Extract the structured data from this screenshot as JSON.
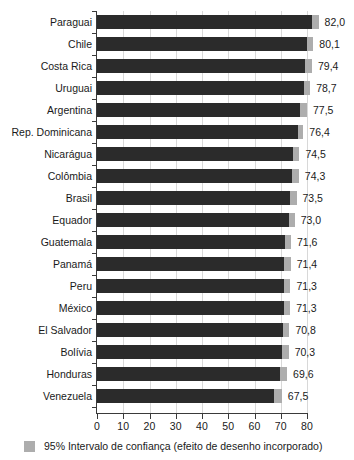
{
  "chart_data": {
    "type": "bar",
    "orientation": "horizontal",
    "title": "",
    "subtitle": "",
    "xlabel": "",
    "ylabel": "",
    "xlim": [
      0,
      80
    ],
    "xticks": [
      0,
      10,
      20,
      30,
      40,
      50,
      60,
      70,
      80
    ],
    "xtick_labels": [
      "0",
      "10",
      "20",
      "30",
      "40",
      "50",
      "60",
      "70",
      "80"
    ],
    "grid": true,
    "grid_axis": "x",
    "legend_position": "bottom-left",
    "categories": [
      "Paraguai",
      "Chile",
      "Costa Rica",
      "Uruguai",
      "Argentina",
      "Rep. Dominicana",
      "Nicarágua",
      "Colômbia",
      "Brasil",
      "Equador",
      "Guatemala",
      "Panamá",
      "Peru",
      "México",
      "El Salvador",
      "Bolívia",
      "Honduras",
      "Venezuela"
    ],
    "values": [
      82.0,
      80.1,
      79.4,
      78.7,
      77.5,
      76.4,
      74.5,
      74.3,
      73.5,
      73.0,
      71.6,
      71.4,
      71.3,
      71.3,
      70.8,
      70.3,
      69.6,
      67.5
    ],
    "value_labels": [
      "82,0",
      "80,1",
      "79,4",
      "78,7",
      "77,5",
      "76,4",
      "74,5",
      "74,3",
      "73,5",
      "73,0",
      "71,6",
      "71,4",
      "71,3",
      "71,3",
      "70,8",
      "70,3",
      "69,6",
      "67,5"
    ],
    "ci_upper": [
      84.4,
      82.4,
      81.9,
      81.2,
      80.0,
      78.6,
      77.1,
      76.9,
      76.0,
      75.3,
      73.9,
      73.8,
      73.7,
      73.6,
      73.3,
      73.0,
      72.4,
      70.4
    ],
    "series": [
      {
        "name": "Estimativa",
        "color": "#2b2b2b",
        "values": [
          82.0,
          80.1,
          79.4,
          78.7,
          77.5,
          76.4,
          74.5,
          74.3,
          73.5,
          73.0,
          71.6,
          71.4,
          71.3,
          71.3,
          70.8,
          70.3,
          69.6,
          67.5
        ]
      },
      {
        "name": "95% Intervalo de confiança (efeito de desenho incorporado)",
        "color": "#adadad",
        "values": [
          84.4,
          82.4,
          81.9,
          81.2,
          80.0,
          78.6,
          77.1,
          76.9,
          76.0,
          75.3,
          73.9,
          73.8,
          73.7,
          73.6,
          73.3,
          73.0,
          72.4,
          70.4
        ]
      }
    ]
  },
  "legend": {
    "swatch_color": "#adadad",
    "label": "95% Intervalo de confiança (efeito de desenho incorporado)"
  },
  "colors": {
    "bar": "#2b2b2b",
    "ci": "#adadad",
    "axis": "#3a3a3a",
    "grid": "#d8d8d8",
    "background": "#ffffff",
    "text": "#1a1a1a"
  }
}
